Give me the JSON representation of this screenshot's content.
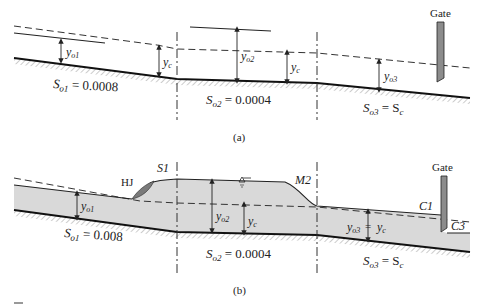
{
  "figure_a": {
    "caption": "(a)",
    "gate_label": "Gate",
    "depth_labels": {
      "yo1": {
        "base": "y",
        "sub": "o1"
      },
      "yc_1": {
        "base": "y",
        "sub": "c"
      },
      "yo2": {
        "base": "y",
        "sub": "o2"
      },
      "yc_2": {
        "base": "y",
        "sub": "c"
      },
      "yo3": {
        "base": "y",
        "sub": "o3"
      }
    },
    "slopes": {
      "s1": {
        "base": "S",
        "sub": "o1",
        "rest": " = 0.0008"
      },
      "s2": {
        "base": "S",
        "sub": "o2",
        "rest": " = 0.0004"
      },
      "s3": {
        "base": "S",
        "sub": "o3",
        "rest": " = S",
        "rest_sub": "c"
      }
    }
  },
  "figure_b": {
    "caption": "(b)",
    "gate_label": "Gate",
    "profile_labels": {
      "hj": "HJ",
      "s1": "S1",
      "m2": "M2",
      "c1": "C1",
      "c3": "C3"
    },
    "water_surface_symbol": "∇",
    "depth_labels": {
      "yo1": {
        "base": "y",
        "sub": "o1"
      },
      "yo2": {
        "base": "y",
        "sub": "o2"
      },
      "yc_1": {
        "base": "y",
        "sub": "c"
      },
      "yo3": {
        "base": "y",
        "sub": "o3"
      },
      "equals": "=",
      "yc_2": {
        "base": "y",
        "sub": "c"
      }
    },
    "slopes": {
      "s1": {
        "base": "S",
        "sub": "o1",
        "rest": " = 0.008"
      },
      "s2": {
        "base": "S",
        "sub": "o2",
        "rest": " = 0.0004"
      },
      "s3": {
        "base": "S",
        "sub": "o3",
        "rest": " = S",
        "rest_sub": "c"
      }
    }
  },
  "colors": {
    "water_fill": "#d9d9d9",
    "gate_fill": "#8c8c8c",
    "hj_fill": "#7a7a7a",
    "line": "#222222"
  }
}
